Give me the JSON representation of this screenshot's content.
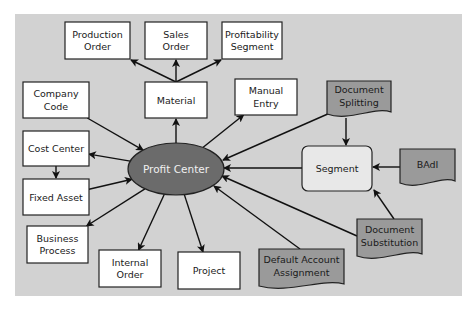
{
  "diagram": {
    "center": {
      "label": "Profit Center",
      "color": "#6b6b6b"
    },
    "nodes": {
      "production_order": [
        "Production",
        "Order"
      ],
      "sales_order": [
        "Sales",
        "Order"
      ],
      "profitability_segment": [
        "Profitability",
        "Segment"
      ],
      "company_code": [
        "Company",
        "Code"
      ],
      "material": [
        "Material"
      ],
      "manual_entry": [
        "Manual",
        "Entry"
      ],
      "document_splitting": [
        "Document",
        "Splitting"
      ],
      "cost_center": [
        "Cost Center"
      ],
      "segment": [
        "Segment"
      ],
      "badi": [
        "BAdI"
      ],
      "fixed_asset": [
        "Fixed Asset"
      ],
      "business_process": [
        "Business",
        "Process"
      ],
      "internal_order": [
        "Internal",
        "Order"
      ],
      "project": [
        "Project"
      ],
      "default_account_assignment": [
        "Default Account",
        "Assignment"
      ],
      "document_substitution": [
        "Document",
        "Substitution"
      ]
    },
    "edges": [
      {
        "from": "material",
        "to": "production_order"
      },
      {
        "from": "material",
        "to": "sales_order"
      },
      {
        "from": "material",
        "to": "profitability_segment"
      },
      {
        "from": "profit_center",
        "to": "material"
      },
      {
        "from": "company_code",
        "to": "profit_center"
      },
      {
        "from": "profit_center",
        "to": "manual_entry"
      },
      {
        "from": "document_splitting",
        "to": "profit_center"
      },
      {
        "from": "document_splitting",
        "to": "segment"
      },
      {
        "from": "profit_center",
        "to": "cost_center"
      },
      {
        "from": "cost_center",
        "to": "fixed_asset"
      },
      {
        "from": "fixed_asset",
        "to": "profit_center"
      },
      {
        "from": "segment",
        "to": "profit_center"
      },
      {
        "from": "badi",
        "to": "segment"
      },
      {
        "from": "profit_center",
        "to": "business_process"
      },
      {
        "from": "profit_center",
        "to": "internal_order"
      },
      {
        "from": "profit_center",
        "to": "project"
      },
      {
        "from": "default_account_assignment",
        "to": "profit_center"
      },
      {
        "from": "document_substitution",
        "to": "profit_center"
      },
      {
        "from": "document_substitution",
        "to": "segment"
      }
    ]
  }
}
